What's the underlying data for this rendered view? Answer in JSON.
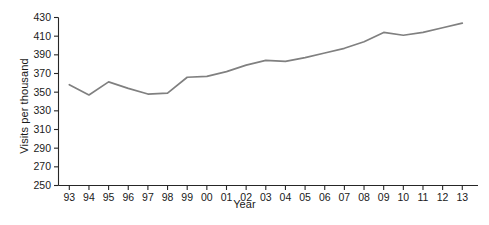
{
  "chart_data": {
    "type": "line",
    "title": "",
    "xlabel": "Year",
    "ylabel": "Visits per thousand",
    "categories": [
      "93",
      "94",
      "95",
      "96",
      "97",
      "98",
      "99",
      "00",
      "01",
      "02",
      "03",
      "04",
      "05",
      "06",
      "07",
      "08",
      "09",
      "10",
      "11",
      "12",
      "13"
    ],
    "values": [
      358,
      347,
      361,
      354,
      348,
      349,
      366,
      367,
      372,
      379,
      384,
      383,
      387,
      392,
      397,
      404,
      414,
      411,
      414,
      419,
      424
    ],
    "series": [
      {
        "name": "Visits per thousand",
        "values": [
          358,
          347,
          361,
          354,
          348,
          349,
          366,
          367,
          372,
          379,
          384,
          383,
          387,
          392,
          397,
          404,
          414,
          411,
          414,
          419,
          424
        ]
      }
    ],
    "ylim": [
      250,
      430
    ],
    "yticks": [
      250,
      270,
      290,
      310,
      330,
      350,
      370,
      390,
      410,
      430
    ],
    "ytick_labels": [
      "250",
      "270",
      "290",
      "310",
      "330",
      "350",
      "370",
      "390",
      "410",
      "430"
    ],
    "xtick_labels": [
      "93",
      "94",
      "95",
      "96",
      "97",
      "98",
      "99",
      "00",
      "01",
      "02",
      "03",
      "04",
      "05",
      "06",
      "07",
      "08",
      "09",
      "10",
      "11",
      "12",
      "13"
    ],
    "grid": false,
    "legend": false,
    "legend_position": "none",
    "line_color": "#808080",
    "axis_color": "#262626",
    "text_color": "#1a1a1a"
  }
}
